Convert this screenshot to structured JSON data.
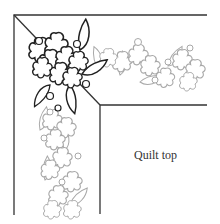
{
  "diagram": {
    "label": "Quilt top",
    "colors": {
      "border_line": "#333333",
      "corner_motif_stroke": "#222222",
      "border_motif_stroke": "#a8a8a8",
      "background": "#ffffff"
    },
    "elements": [
      {
        "name": "outer-border",
        "type": "line"
      },
      {
        "name": "inner-border",
        "type": "line"
      },
      {
        "name": "mitered-corner-seam",
        "type": "line"
      },
      {
        "name": "corner-flower-cluster",
        "type": "motif",
        "style": "dark outline"
      },
      {
        "name": "top-border-vine",
        "type": "motif",
        "style": "gray outline"
      },
      {
        "name": "left-border-vine",
        "type": "motif",
        "style": "gray outline"
      }
    ]
  }
}
